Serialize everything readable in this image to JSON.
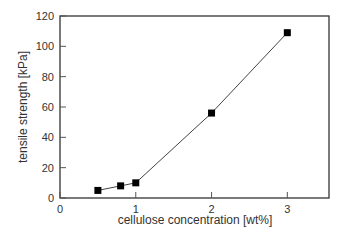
{
  "chart_data": {
    "type": "line",
    "title": "",
    "xlabel": "cellulose concentration [wt%]",
    "ylabel": "tensile strength [kPa]",
    "x": [
      0.5,
      0.8,
      1.0,
      2.0,
      3.0
    ],
    "series": [
      {
        "name": "tensile strength",
        "values": [
          5,
          8,
          10,
          56,
          109
        ],
        "marker": "square",
        "color": "#000000"
      }
    ],
    "xlim": [
      0,
      3.55
    ],
    "ylim": [
      0,
      120
    ],
    "xticks": [
      "0",
      "1",
      "2",
      "3"
    ],
    "yticks": [
      "0",
      "20",
      "40",
      "60",
      "80",
      "100",
      "120"
    ],
    "grid": false,
    "legend": "none"
  }
}
